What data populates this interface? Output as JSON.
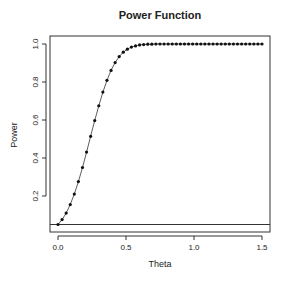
{
  "chart_data": {
    "type": "line",
    "title": "Power Function",
    "xlabel": "Theta",
    "ylabel": "Power",
    "xlim": [
      -0.05,
      1.55
    ],
    "ylim": [
      0.02,
      1.03
    ],
    "x_ticks": [
      0.0,
      0.5,
      1.0,
      1.5
    ],
    "x_tick_labels": [
      "0.0",
      "0.5",
      "1.0",
      "1.5"
    ],
    "y_ticks": [
      0.2,
      0.4,
      0.6,
      0.8,
      1.0
    ],
    "y_tick_labels": [
      "0.2",
      "0.4",
      "0.6",
      "0.8",
      "1.0"
    ],
    "grid": false,
    "legend": null,
    "reference_line": {
      "orientation": "horizontal",
      "y": 0.05,
      "label": "significance level"
    },
    "series": [
      {
        "name": "power",
        "style": "line-with-points",
        "x": [
          0.0,
          0.03,
          0.06,
          0.09,
          0.12,
          0.15,
          0.18,
          0.21,
          0.24,
          0.27,
          0.3,
          0.33,
          0.36,
          0.39,
          0.42,
          0.45,
          0.48,
          0.51,
          0.54,
          0.57,
          0.6,
          0.63,
          0.66,
          0.69,
          0.72,
          0.75,
          0.78,
          0.81,
          0.84,
          0.87,
          0.9,
          0.93,
          0.96,
          0.99,
          1.02,
          1.05,
          1.08,
          1.11,
          1.14,
          1.17,
          1.2,
          1.23,
          1.26,
          1.29,
          1.32,
          1.35,
          1.38,
          1.41,
          1.44,
          1.47,
          1.5
        ],
        "values": [
          0.05,
          0.076,
          0.11,
          0.155,
          0.21,
          0.276,
          0.35,
          0.431,
          0.514,
          0.597,
          0.675,
          0.747,
          0.809,
          0.861,
          0.902,
          0.934,
          0.957,
          0.973,
          0.984,
          0.99,
          0.995,
          0.997,
          0.999,
          0.999,
          1.0,
          1.0,
          1.0,
          1.0,
          1.0,
          1.0,
          1.0,
          1.0,
          1.0,
          1.0,
          1.0,
          1.0,
          1.0,
          1.0,
          1.0,
          1.0,
          1.0,
          1.0,
          1.0,
          1.0,
          1.0,
          1.0,
          1.0,
          1.0,
          1.0,
          1.0,
          1.0
        ]
      }
    ]
  }
}
